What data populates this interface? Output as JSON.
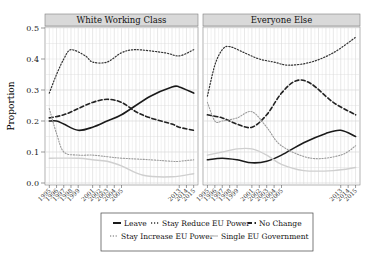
{
  "chart_data": {
    "type": "line",
    "ylabel": "Proportion",
    "xlabel": "",
    "ylim": [
      0.0,
      0.5
    ],
    "yticks": [
      "0.0",
      "0.1",
      "0.2",
      "0.3",
      "0.4",
      "0.5"
    ],
    "xticks": [
      "1995",
      "1996",
      "1997",
      "1998",
      "1999",
      "2001",
      "2002",
      "2003",
      "2004",
      "2005",
      "2013",
      "2014",
      "2015"
    ],
    "grid": true,
    "legend_position": "bottom",
    "legend": [
      "Leave",
      "Stay Reduce EU Power",
      "No Change",
      "Stay Increase EU Power",
      "Single EU Government"
    ],
    "panels": [
      {
        "title": "White Working Class",
        "series": [
          {
            "name": "Leave",
            "x": [
              1995,
              1996,
              1997,
              1999,
              2001,
              2003,
              2005,
              2009,
              2012,
              2013,
              2015
            ],
            "values": [
              0.2,
              0.2,
              0.19,
              0.17,
              0.18,
              0.2,
              0.22,
              0.28,
              0.31,
              0.31,
              0.29
            ]
          },
          {
            "name": "Stay Reduce EU Power",
            "x": [
              1995,
              1996,
              1997,
              1998,
              2000,
              2001,
              2003,
              2005,
              2007,
              2011,
              2013,
              2015
            ],
            "values": [
              0.29,
              0.35,
              0.4,
              0.43,
              0.41,
              0.39,
              0.39,
              0.42,
              0.43,
              0.42,
              0.41,
              0.43
            ]
          },
          {
            "name": "No Change",
            "x": [
              1995,
              1997,
              1999,
              2001,
              2003,
              2005,
              2007,
              2009,
              2012,
              2013,
              2015
            ],
            "values": [
              0.21,
              0.22,
              0.24,
              0.26,
              0.27,
              0.26,
              0.23,
              0.21,
              0.19,
              0.18,
              0.17
            ]
          },
          {
            "name": "Stay Increase EU Power",
            "x": [
              1995,
              1996,
              1997,
              1999,
              2001,
              2003,
              2005,
              2009,
              2012,
              2013,
              2015
            ],
            "values": [
              0.24,
              0.16,
              0.1,
              0.09,
              0.09,
              0.085,
              0.08,
              0.075,
              0.07,
              0.07,
              0.075
            ]
          },
          {
            "name": "Single EU Government",
            "x": [
              1995,
              1999,
              2001,
              2003,
              2005,
              2008,
              2012,
              2015
            ],
            "values": [
              0.08,
              0.08,
              0.075,
              0.07,
              0.055,
              0.025,
              0.02,
              0.03
            ]
          }
        ]
      },
      {
        "title": "Everyone Else",
        "series": [
          {
            "name": "Leave",
            "x": [
              1995,
              1997,
              1999,
              2001,
              2003,
              2005,
              2008,
              2011,
              2013,
              2015
            ],
            "values": [
              0.075,
              0.08,
              0.075,
              0.065,
              0.07,
              0.09,
              0.13,
              0.16,
              0.17,
              0.15
            ]
          },
          {
            "name": "Stay Reduce EU Power",
            "x": [
              1995,
              1996,
              1997,
              1998,
              2000,
              2002,
              2004,
              2006,
              2009,
              2012,
              2015
            ],
            "values": [
              0.28,
              0.38,
              0.43,
              0.44,
              0.42,
              0.4,
              0.39,
              0.38,
              0.39,
              0.42,
              0.47
            ]
          },
          {
            "name": "No Change",
            "x": [
              1995,
              1997,
              1999,
              2001,
              2003,
              2005,
              2007,
              2009,
              2012,
              2015
            ],
            "values": [
              0.22,
              0.21,
              0.19,
              0.18,
              0.22,
              0.29,
              0.33,
              0.32,
              0.26,
              0.22
            ]
          },
          {
            "name": "Stay Increase EU Power",
            "x": [
              1995,
              1996,
              1997,
              1999,
              2001,
              2003,
              2005,
              2009,
              2013,
              2015
            ],
            "values": [
              0.26,
              0.2,
              0.2,
              0.21,
              0.23,
              0.18,
              0.12,
              0.08,
              0.09,
              0.12
            ]
          },
          {
            "name": "Single EU Government",
            "x": [
              1995,
              1997,
              1999,
              2001,
              2003,
              2005,
              2008,
              2012,
              2015
            ],
            "values": [
              0.09,
              0.1,
              0.11,
              0.11,
              0.09,
              0.06,
              0.04,
              0.04,
              0.05
            ]
          }
        ]
      }
    ]
  },
  "styles": {
    "Leave": {
      "color": "#1a1a1a",
      "width": 1.6,
      "dash": ""
    },
    "Stay Reduce EU Power": {
      "color": "#333333",
      "width": 1.2,
      "dash": "1.2,1.8"
    },
    "No Change": {
      "color": "#222222",
      "width": 1.6,
      "dash": "4,2.5"
    },
    "Stay Increase EU Power": {
      "color": "#9a9a9a",
      "width": 1.1,
      "dash": "1.2,1.6"
    },
    "Single EU Government": {
      "color": "#cfcfcf",
      "width": 1.4,
      "dash": ""
    }
  },
  "colors": {
    "strip_bg": "#d9d9d9",
    "grid": "#d8d8d8",
    "panel_border": "#7f7f7f"
  }
}
